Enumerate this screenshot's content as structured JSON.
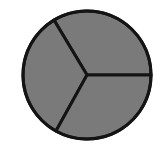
{
  "figure": {
    "background_color": "#ffffff",
    "width": 162,
    "height": 156
  },
  "chart_data": {
    "type": "pie",
    "title": "",
    "subtitle": "",
    "xlabel": "",
    "ylabel": "",
    "labels": [
      "Sector 1",
      "Sector 2",
      "Sector 3"
    ],
    "values": [
      33.3,
      33.3,
      33.3
    ],
    "value_unit": "%",
    "total": 100,
    "slice_count": 3,
    "equal_slices": true,
    "start_angle_deg": 0,
    "direction": "counterclockwise",
    "boundary_angles_deg": [
      0,
      121,
      241
    ],
    "legend": {
      "visible": false,
      "position": "none",
      "entries": []
    },
    "grid": false,
    "axes_visible": false,
    "data_labels_visible": false,
    "annotations": [],
    "colors": {
      "slice_fill": "#7a7a7a",
      "slice_fills": [
        "#7a7a7a",
        "#7a7a7a",
        "#7a7a7a"
      ],
      "outline": "#141414",
      "background": "#ffffff"
    },
    "geometry": {
      "center_x": 87,
      "center_y": 75,
      "radius": 64,
      "outline_width": 3
    }
  }
}
